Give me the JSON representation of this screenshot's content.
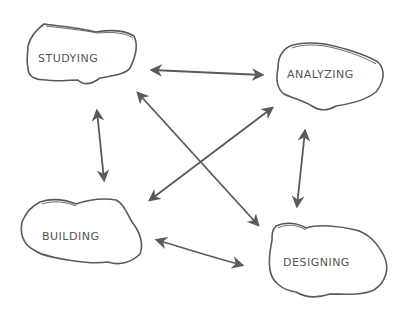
{
  "diagram": {
    "nodes": [
      {
        "id": "studying",
        "label": "Studying"
      },
      {
        "id": "analyzing",
        "label": "Analyzing"
      },
      {
        "id": "building",
        "label": "Building"
      },
      {
        "id": "designing",
        "label": "Designing"
      }
    ],
    "edges": [
      {
        "from": "studying",
        "to": "analyzing",
        "bidirectional": true
      },
      {
        "from": "studying",
        "to": "building",
        "bidirectional": true
      },
      {
        "from": "studying",
        "to": "designing",
        "bidirectional": true
      },
      {
        "from": "analyzing",
        "to": "building",
        "bidirectional": true
      },
      {
        "from": "analyzing",
        "to": "designing",
        "bidirectional": true
      },
      {
        "from": "building",
        "to": "designing",
        "bidirectional": true
      }
    ],
    "stroke_color": "#5a5a5a"
  }
}
